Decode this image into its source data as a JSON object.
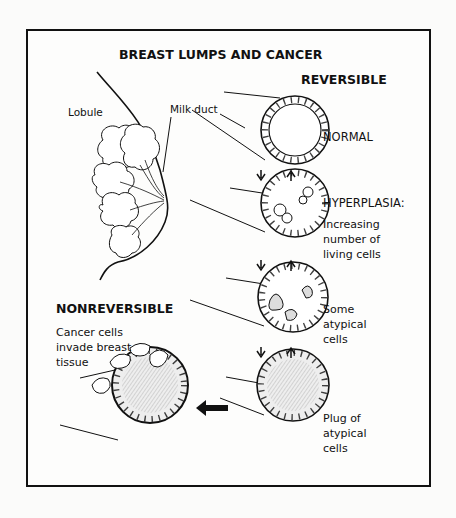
{
  "figure": {
    "title": "BREAST LUMPS AND CANCER",
    "sections": {
      "reversible": "REVERSIBLE",
      "nonreversible": "NONREVERSIBLE"
    },
    "anatomy_labels": {
      "lobule": "Lobule",
      "milk_duct": "Milk duct"
    },
    "stages": [
      {
        "id": "normal",
        "label": "NORMAL"
      },
      {
        "id": "hyperplasia",
        "label": "HYPERPLASIA:",
        "desc_lines": [
          "Increasing",
          "number of",
          "living cells"
        ]
      },
      {
        "id": "atypical",
        "desc_lines": [
          "Some",
          "atypical",
          "cells"
        ]
      },
      {
        "id": "plug",
        "desc_lines": [
          "Plug of",
          "atypical",
          "cells"
        ]
      }
    ],
    "cancer": {
      "desc_lines": [
        "Cancer cells",
        "invade breast",
        "tissue"
      ]
    },
    "colors": {
      "ink": "#111111",
      "paper": "#fdfdfc"
    }
  }
}
